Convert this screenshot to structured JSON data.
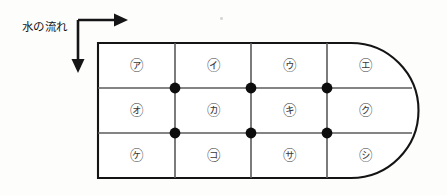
{
  "figure": {
    "background_color": "#fdfdfc",
    "ink_color": "#1a1a1a",
    "grid_line_color": "#555555",
    "dot_color": "#0d0d0d",
    "flow_label": "水の流れ",
    "flow_arrows": [
      {
        "name": "right-arrow",
        "direction": "right",
        "meaning": "downstream"
      },
      {
        "name": "down-arrow",
        "direction": "down",
        "meaning": "downstream"
      }
    ],
    "tank": {
      "shape": "stadium-right-rounded-rectangle",
      "left_edge": "straight",
      "right_edge": "rounded",
      "rows": 3,
      "columns": 4,
      "interior_dot_count": 6,
      "bounds": {
        "x": 98,
        "y": 43,
        "width": 320,
        "height": 135
      },
      "corner_radius": 67,
      "column_divider_x": [
        175,
        251,
        327
      ],
      "row_divider_y": [
        88,
        133
      ]
    },
    "cells": [
      {
        "row": 1,
        "col": 1,
        "label": "㋐",
        "x": 136,
        "y": 66
      },
      {
        "row": 1,
        "col": 2,
        "label": "㋑",
        "x": 213,
        "y": 66
      },
      {
        "row": 1,
        "col": 3,
        "label": "㋒",
        "x": 289,
        "y": 66
      },
      {
        "row": 1,
        "col": 4,
        "label": "㋓",
        "x": 365,
        "y": 66
      },
      {
        "row": 2,
        "col": 1,
        "label": "㋔",
        "x": 136,
        "y": 111
      },
      {
        "row": 2,
        "col": 2,
        "label": "㋕",
        "x": 213,
        "y": 111
      },
      {
        "row": 2,
        "col": 3,
        "label": "㋖",
        "x": 289,
        "y": 111
      },
      {
        "row": 2,
        "col": 4,
        "label": "㋗",
        "x": 365,
        "y": 111
      },
      {
        "row": 3,
        "col": 1,
        "label": "㋘",
        "x": 136,
        "y": 156
      },
      {
        "row": 3,
        "col": 2,
        "label": "㋙",
        "x": 213,
        "y": 156
      },
      {
        "row": 3,
        "col": 3,
        "label": "㋚",
        "x": 289,
        "y": 156
      },
      {
        "row": 3,
        "col": 4,
        "label": "㋛",
        "x": 365,
        "y": 156
      }
    ],
    "dots": [
      {
        "name": "junction-dot-1",
        "x": 175,
        "y": 88
      },
      {
        "name": "junction-dot-2",
        "x": 251,
        "y": 88
      },
      {
        "name": "junction-dot-3",
        "x": 327,
        "y": 88
      },
      {
        "name": "junction-dot-4",
        "x": 175,
        "y": 133
      },
      {
        "name": "junction-dot-5",
        "x": 251,
        "y": 133
      },
      {
        "name": "junction-dot-6",
        "x": 327,
        "y": 133
      }
    ]
  }
}
